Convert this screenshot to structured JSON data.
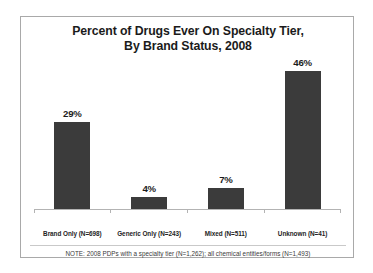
{
  "chart_data": {
    "type": "bar",
    "title": "Percent of Drugs Ever On Specialty Tier, By Brand Status, 2008",
    "title_lines": [
      "Percent of Drugs Ever On Specialty Tier,",
      "By Brand Status, 2008"
    ],
    "categories": [
      "Brand Only (N=698)",
      "Generic Only (N=243)",
      "Mixed (N=511)",
      "Unknown (N=41)"
    ],
    "values": [
      29,
      4,
      7,
      46
    ],
    "value_labels": [
      "29%",
      "4%",
      "7%",
      "46%"
    ],
    "xlabel": "",
    "ylabel": "",
    "ylim": [
      0,
      50
    ],
    "grid": false,
    "legend": "none",
    "bar_color": "#3b3b3b",
    "axis_color": "#b3b3b3",
    "note": "NOTE: 2008 PDPs with a specialty tier (N=1,262); all chemical entities/forms (N=1,493)"
  },
  "frame": {
    "border_color": "#a9a9a9",
    "background": "#ffffff"
  }
}
